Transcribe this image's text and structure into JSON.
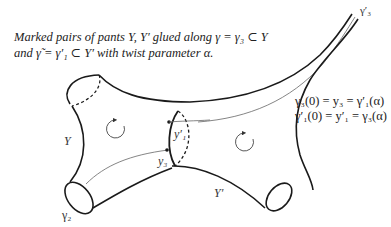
{
  "figure": {
    "caption": {
      "line1": "Marked pairs of pants Y, Y′ glued along γ = γ₃ ⊂ Y",
      "line2": "and γ̃ = γ′₁ ⊂ Y′ with twist parameter α."
    },
    "equations": {
      "line1": "γ₃(0) = y₃ = γ′₁(α)",
      "line2": "γ′₁(0) = y′₁ = γ₃(α)"
    },
    "labels": {
      "pants_left": "Y",
      "pants_right": "Y′",
      "boundary_gamma2": "γ₂",
      "boundary_gamma3_prime": "γ′₃",
      "point_y3": "y₃",
      "point_y1_prime": "y′₁"
    },
    "icons": {
      "left_rotation": "clockwise-rotation-arrow",
      "right_rotation": "clockwise-rotation-arrow"
    },
    "colors": {
      "stroke": "#1a1a1a",
      "thin_stroke": "#555555",
      "text": "#222222",
      "background": "#ffffff"
    }
  }
}
